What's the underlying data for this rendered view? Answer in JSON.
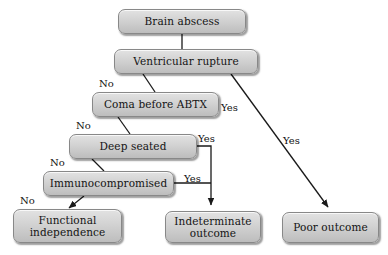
{
  "diagram": {
    "type": "flowchart",
    "background_color": "#ffffff",
    "node_fill_top": "#e2e2e2",
    "node_fill_bottom": "#bdbdbd",
    "node_border_color": "#888888",
    "text_color": "#141414",
    "edge_color": "#1a1a1a",
    "nodes": [
      {
        "id": "brain-abscess",
        "label": "Brain abscess",
        "x": 118,
        "y": 9,
        "w": 128,
        "h": 25
      },
      {
        "id": "ventricular-rupture",
        "label": "Ventricular rupture",
        "x": 114,
        "y": 49,
        "w": 144,
        "h": 25
      },
      {
        "id": "coma-before-abtx",
        "label": "Coma before ABTX",
        "x": 92,
        "y": 92,
        "w": 127,
        "h": 25
      },
      {
        "id": "deep-seated",
        "label": "Deep seated",
        "x": 69,
        "y": 134,
        "w": 128,
        "h": 25
      },
      {
        "id": "immunocompromised",
        "label": "Immunocompromised",
        "x": 43,
        "y": 171,
        "w": 131,
        "h": 25
      },
      {
        "id": "functional-independence",
        "label": "Functional\nindependence",
        "x": 13,
        "y": 209,
        "w": 109,
        "h": 34
      },
      {
        "id": "indeterminate-outcome",
        "label": "Indeterminate\noutcome",
        "x": 165,
        "y": 211,
        "w": 96,
        "h": 32
      },
      {
        "id": "poor-outcome",
        "label": "Poor outcome",
        "x": 282,
        "y": 212,
        "w": 97,
        "h": 31
      }
    ],
    "edge_labels": [
      {
        "id": "no-coma",
        "text": "No",
        "x": 99,
        "y": 78
      },
      {
        "id": "yes-ventricular",
        "text": "Yes",
        "x": 221,
        "y": 102
      },
      {
        "id": "no-deep-seated",
        "text": "No",
        "x": 76,
        "y": 120
      },
      {
        "id": "yes-coma",
        "text": "Yes",
        "x": 198,
        "y": 133
      },
      {
        "id": "yes-poor-outcome",
        "text": "Yes",
        "x": 283,
        "y": 135
      },
      {
        "id": "no-immunocompromised",
        "text": "No",
        "x": 50,
        "y": 157
      },
      {
        "id": "yes-deep-seated",
        "text": "Yes",
        "x": 184,
        "y": 173
      },
      {
        "id": "no-functional",
        "text": "No",
        "x": 20,
        "y": 195
      }
    ]
  }
}
